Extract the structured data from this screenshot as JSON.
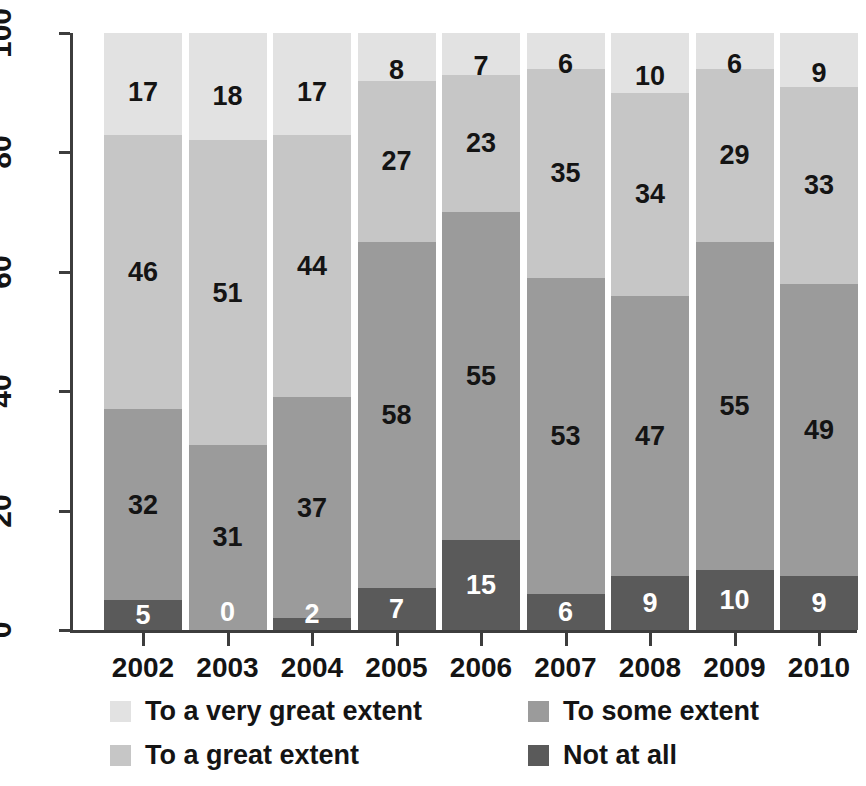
{
  "chart_data": {
    "type": "bar",
    "subtype": "stacked-bar-100-percent",
    "title": "",
    "subtitle": "",
    "xlabel": "",
    "ylabel": "",
    "categories": [
      "2002",
      "2003",
      "2004",
      "2005",
      "2006",
      "2007",
      "2008",
      "2009",
      "2010"
    ],
    "ylim": [
      0,
      100
    ],
    "yticks": [
      0,
      20,
      40,
      60,
      80,
      100
    ],
    "ytick_labels": [
      "0",
      "20",
      "40",
      "60",
      "80",
      "100"
    ],
    "grid": false,
    "legend_position": "bottom",
    "stack_order_bottom_to_top": [
      "Not at all",
      "To some extent",
      "To a great extent",
      "To a very great extent"
    ],
    "series": [
      {
        "name": "To a very great extent",
        "color": "#e2e2e2",
        "values": [
          17,
          18,
          17,
          8,
          7,
          6,
          10,
          6,
          9
        ]
      },
      {
        "name": "To a great extent",
        "color": "#c6c6c6",
        "values": [
          46,
          51,
          44,
          27,
          23,
          35,
          34,
          29,
          33
        ]
      },
      {
        "name": "To some extent",
        "color": "#9b9b9b",
        "values": [
          32,
          31,
          37,
          58,
          55,
          53,
          47,
          55,
          49
        ]
      },
      {
        "name": "Not at all",
        "color": "#5a5a5a",
        "values": [
          5,
          0,
          2,
          7,
          15,
          6,
          9,
          10,
          9
        ]
      }
    ],
    "column_totals": [
      100,
      100,
      100,
      100,
      100,
      100,
      100,
      100,
      100
    ]
  },
  "legend": {
    "items": [
      {
        "label": "To a very great extent",
        "color": "#e2e2e2",
        "column": 0,
        "row": 0
      },
      {
        "label": "To a great extent",
        "color": "#c6c6c6",
        "column": 0,
        "row": 1
      },
      {
        "label": "To some extent",
        "color": "#9b9b9b",
        "column": 1,
        "row": 0
      },
      {
        "label": "Not at all",
        "color": "#5a5a5a",
        "column": 1,
        "row": 1
      }
    ]
  },
  "axis": {
    "line_color": "#3d3d3d",
    "label_color": "#141414"
  }
}
